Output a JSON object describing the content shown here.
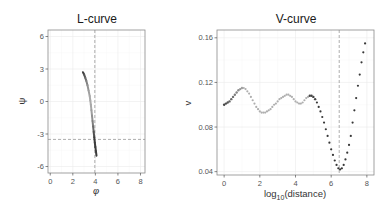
{
  "chart_data": [
    {
      "type": "line",
      "title": "L-curve",
      "xlabel": "φ",
      "ylabel": "ψ",
      "xlim": [
        -0.2,
        8.4
      ],
      "ylim": [
        -6.6,
        6.6
      ],
      "xticks": [
        0,
        2,
        4,
        6,
        8
      ],
      "yticks": [
        -6,
        -3,
        0,
        3,
        6
      ],
      "grid": true,
      "vline": 3.95,
      "hline": -3.5,
      "x": [
        2.9,
        3.0,
        3.1,
        3.2,
        3.3,
        3.4,
        3.5,
        3.55,
        3.6,
        3.65,
        3.7,
        3.75,
        3.8,
        3.85,
        3.9,
        3.95,
        4.0,
        4.05,
        4.1
      ],
      "y": [
        2.7,
        2.5,
        2.2,
        1.9,
        1.5,
        1.0,
        0.5,
        0.1,
        -0.3,
        -0.8,
        -1.3,
        -1.8,
        -2.3,
        -2.8,
        -3.3,
        -3.8,
        -4.2,
        -4.6,
        -5.0
      ]
    },
    {
      "type": "scatter",
      "title": "V-curve",
      "xlabel": "log10(distance)",
      "ylabel": "v",
      "xlim": [
        -0.4,
        8.4
      ],
      "ylim": [
        0.037,
        0.167
      ],
      "xticks": [
        0,
        2,
        4,
        6,
        8
      ],
      "yticks": [
        0.04,
        0.08,
        0.12,
        0.16
      ],
      "grid": true,
      "vline": 6.45,
      "x": [
        0.0,
        0.1,
        0.2,
        0.3,
        0.4,
        0.5,
        0.6,
        0.7,
        0.8,
        0.9,
        1.0,
        1.1,
        1.2,
        1.3,
        1.4,
        1.5,
        1.6,
        1.7,
        1.8,
        1.9,
        2.0,
        2.1,
        2.2,
        2.3,
        2.4,
        2.5,
        2.6,
        2.7,
        2.8,
        2.9,
        3.0,
        3.1,
        3.2,
        3.3,
        3.4,
        3.5,
        3.6,
        3.7,
        3.8,
        3.9,
        4.0,
        4.1,
        4.2,
        4.3,
        4.4,
        4.5,
        4.6,
        4.7,
        4.8,
        4.9,
        5.0,
        5.1,
        5.2,
        5.3,
        5.4,
        5.5,
        5.6,
        5.7,
        5.8,
        5.9,
        6.0,
        6.1,
        6.2,
        6.3,
        6.4,
        6.5,
        6.6,
        6.7,
        6.8,
        6.9,
        7.0,
        7.1,
        7.2,
        7.3,
        7.4,
        7.5,
        7.6,
        7.7,
        7.8,
        7.9
      ],
      "y": [
        0.1,
        0.101,
        0.102,
        0.103,
        0.105,
        0.107,
        0.109,
        0.111,
        0.113,
        0.114,
        0.115,
        0.115,
        0.114,
        0.112,
        0.11,
        0.107,
        0.104,
        0.101,
        0.098,
        0.096,
        0.094,
        0.093,
        0.093,
        0.093,
        0.094,
        0.095,
        0.096,
        0.098,
        0.1,
        0.101,
        0.103,
        0.105,
        0.106,
        0.107,
        0.108,
        0.109,
        0.109,
        0.108,
        0.107,
        0.105,
        0.103,
        0.102,
        0.101,
        0.101,
        0.102,
        0.104,
        0.106,
        0.107,
        0.108,
        0.108,
        0.107,
        0.105,
        0.102,
        0.098,
        0.094,
        0.089,
        0.084,
        0.078,
        0.072,
        0.066,
        0.06,
        0.055,
        0.05,
        0.046,
        0.043,
        0.042,
        0.043,
        0.046,
        0.051,
        0.057,
        0.064,
        0.072,
        0.084,
        0.095,
        0.106,
        0.117,
        0.127,
        0.138,
        0.147,
        0.155,
        0.162
      ]
    }
  ],
  "panels": {
    "left": {
      "title": "L-curve",
      "xlabel": "φ",
      "ylabel": "ψ"
    },
    "right": {
      "title": "V-curve",
      "xlabel_main": "log",
      "xlabel_sub": "10",
      "xlabel_rest": "(distance)",
      "ylabel": "v"
    }
  }
}
